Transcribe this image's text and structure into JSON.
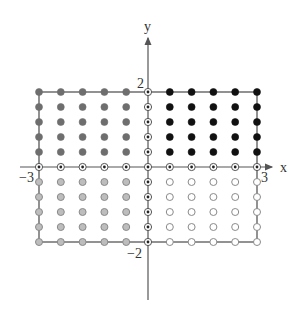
{
  "diagram": {
    "type": "lattice-points-rectangle",
    "axes": {
      "x_label": "x",
      "y_label": "y",
      "x_range": [
        -3,
        3
      ],
      "y_range": [
        -2,
        2
      ]
    },
    "tick_labels": {
      "x_min": "−3",
      "x_max": "3",
      "y_max": "2",
      "y_min": "−2"
    },
    "grid": {
      "x_values": [
        -3,
        -2.4,
        -1.8,
        -1.2,
        -0.6,
        0,
        0.6,
        1.2,
        1.8,
        2.4,
        3
      ],
      "y_values": [
        2,
        1.6,
        1.2,
        0.8,
        0.4,
        0,
        -0.4,
        -0.8,
        -1.2,
        -1.6,
        -2
      ]
    },
    "marker_styles": {
      "upper_left": {
        "description": "filled dark gray",
        "fill": "#6e6e6e",
        "stroke": "#6e6e6e"
      },
      "upper_right": {
        "description": "filled black",
        "fill": "#111111",
        "stroke": "#111111"
      },
      "lower_left": {
        "description": "light gray with gray outline",
        "fill": "#bdbdbd",
        "stroke": "#8a8a8a"
      },
      "lower_right": {
        "description": "hollow white",
        "fill": "#ffffff",
        "stroke": "#8a8a8a"
      },
      "on_axis": {
        "description": "circle with center dot",
        "fill": "#ffffff",
        "stroke": "#555555",
        "dot": "#222222"
      }
    },
    "colors": {
      "axis": "#555555",
      "border": "#777777",
      "text": "#333333"
    }
  }
}
